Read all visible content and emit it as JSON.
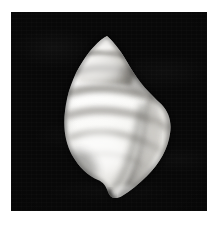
{
  "page": {
    "background_color": "#ffffff",
    "width": 221,
    "height": 225,
    "margin_left": 11,
    "margin_top": 12
  },
  "photo_plate": {
    "label": "specimen-photograph",
    "background_color": "#080808",
    "left": 11,
    "top": 12,
    "width": 196,
    "height": 199,
    "rendering": "grayscale",
    "lighting": "upper-left key light, deep shadow at right aperture",
    "vignette": true
  },
  "specimen": {
    "name": "gastropod-shell",
    "common_description": "marine snail shell, ovate-conic with pointed spire",
    "orientation": "apertural view, apex up, anterior canal down",
    "colors": {
      "highlight": "#fcfcfc",
      "body_white": "#f2f1ee",
      "band_grey": "#9a9893",
      "band_grey_dark": "#6f6d69",
      "aperture_shadow": "#3a3936",
      "lip_edge": "#e8e7e3",
      "outline_shadow": "#1b1b1a",
      "background": "#080808"
    },
    "geometry": {
      "apex_x": 96,
      "apex_y": 26,
      "widest_y": 98,
      "left_edge_x": 55,
      "right_edge_x": 161,
      "bottom_tip_y": 184
    },
    "features": [
      {
        "name": "apex",
        "description": "sharply pointed protoconch at the top of the spire"
      },
      {
        "name": "spire",
        "description": "short conical spire of about three stepped whorls"
      },
      {
        "name": "suture",
        "description": "narrow incised lines separating successive whorls"
      },
      {
        "name": "body-whorl",
        "description": "large inflated final whorl occupying most of the shell"
      },
      {
        "name": "spiral-bands",
        "description": "five broad greyish spiral colour bands crossing the body whorl"
      },
      {
        "name": "outer-lip",
        "description": "smooth curved outer lip along the right margin"
      },
      {
        "name": "aperture",
        "description": "elongate shadowed aperture running down the right side"
      },
      {
        "name": "columella",
        "description": "pale columellar pillar visible inside the aperture"
      },
      {
        "name": "anterior-canal",
        "description": "short notched siphonal canal at the base"
      }
    ],
    "spiral_bands": [
      {
        "index": 1,
        "center_y": 46,
        "thickness": 5,
        "tone": "#8f8d88"
      },
      {
        "index": 2,
        "center_y": 62,
        "thickness": 7,
        "tone": "#868480"
      },
      {
        "index": 3,
        "center_y": 82,
        "thickness": 8,
        "tone": "#8c8a85"
      },
      {
        "index": 4,
        "center_y": 104,
        "thickness": 8,
        "tone": "#95938e"
      },
      {
        "index": 5,
        "center_y": 124,
        "thickness": 7,
        "tone": "#9e9c97"
      }
    ]
  }
}
